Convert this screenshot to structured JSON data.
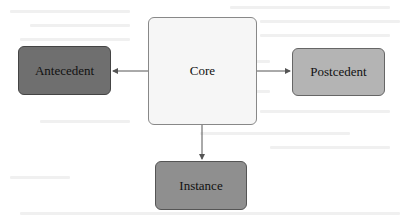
{
  "diagram": {
    "nodes": [
      {
        "id": "antecedent",
        "label": "Antecedent",
        "fill": "#6f6f6f"
      },
      {
        "id": "core",
        "label": "Core",
        "fill": "#f6f6f6"
      },
      {
        "id": "postcedent",
        "label": "Postcedent",
        "fill": "#b4b4b4"
      },
      {
        "id": "instance",
        "label": "Instance",
        "fill": "#8f8f8f"
      }
    ],
    "edges": [
      {
        "from": "core",
        "to": "antecedent"
      },
      {
        "from": "core",
        "to": "postcedent"
      },
      {
        "from": "core",
        "to": "instance"
      }
    ],
    "edge_color": "#555555"
  }
}
